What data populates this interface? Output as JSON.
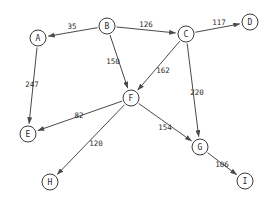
{
  "diagram": {
    "type": "directed-weighted-graph",
    "background_color": "#ffffff",
    "node_fill_color": "#ffffff",
    "node_stroke_color": "#3c3c3c",
    "edge_color": "#4a4a4a",
    "text_color": "#2b2b2b",
    "node_radius": 8,
    "nodes": [
      {
        "id": "A",
        "label": "A",
        "x": 38,
        "y": 38
      },
      {
        "id": "B",
        "label": "B",
        "x": 107,
        "y": 26
      },
      {
        "id": "C",
        "label": "C",
        "x": 186,
        "y": 34
      },
      {
        "id": "D",
        "label": "D",
        "x": 250,
        "y": 22
      },
      {
        "id": "E",
        "label": "E",
        "x": 28,
        "y": 134
      },
      {
        "id": "F",
        "label": "F",
        "x": 131,
        "y": 98
      },
      {
        "id": "G",
        "label": "G",
        "x": 200,
        "y": 147
      },
      {
        "id": "H",
        "label": "H",
        "x": 50,
        "y": 182
      },
      {
        "id": "I",
        "label": "I",
        "x": 245,
        "y": 181
      }
    ],
    "edges": [
      {
        "from": "B",
        "to": "A",
        "weight": "35",
        "label_x": 72,
        "label_y": 26
      },
      {
        "from": "B",
        "to": "C",
        "weight": "126",
        "label_x": 146,
        "label_y": 24
      },
      {
        "from": "C",
        "to": "D",
        "weight": "117",
        "label_x": 219,
        "label_y": 22
      },
      {
        "from": "A",
        "to": "E",
        "weight": "247",
        "label_x": 32,
        "label_y": 84
      },
      {
        "from": "B",
        "to": "F",
        "weight": "150",
        "label_x": 113,
        "label_y": 61
      },
      {
        "from": "C",
        "to": "F",
        "weight": "162",
        "label_x": 163,
        "label_y": 70
      },
      {
        "from": "C",
        "to": "G",
        "weight": "220",
        "label_x": 197,
        "label_y": 92
      },
      {
        "from": "F",
        "to": "E",
        "weight": "82",
        "label_x": 79,
        "label_y": 115
      },
      {
        "from": "F",
        "to": "H",
        "weight": "120",
        "label_x": 96,
        "label_y": 143
      },
      {
        "from": "F",
        "to": "G",
        "weight": "154",
        "label_x": 165,
        "label_y": 127
      },
      {
        "from": "G",
        "to": "I",
        "weight": "106",
        "label_x": 222,
        "label_y": 164
      }
    ]
  }
}
